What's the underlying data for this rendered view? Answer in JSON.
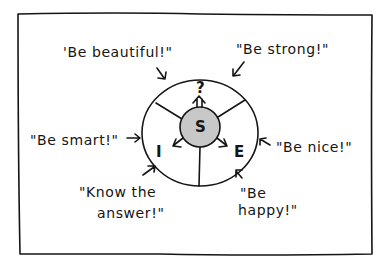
{
  "diagram": {
    "center_label": "S",
    "segments": [
      {
        "id": "top",
        "label": "?"
      },
      {
        "id": "left",
        "label": "I"
      },
      {
        "id": "right",
        "label": "E"
      }
    ],
    "center_fill": "#c8c8c8",
    "callouts": [
      {
        "id": "beautiful",
        "text": "'Be beautiful!\""
      },
      {
        "id": "strong",
        "text": "\"Be strong!\""
      },
      {
        "id": "smart",
        "text": "\"Be smart!\""
      },
      {
        "id": "nice",
        "text": "\"Be nice!\""
      },
      {
        "id": "know-line1",
        "text": "\"Know the"
      },
      {
        "id": "know-line2",
        "text": "answer!\""
      },
      {
        "id": "happy-line1",
        "text": "\"Be"
      },
      {
        "id": "happy-line2",
        "text": "happy!\""
      }
    ]
  }
}
